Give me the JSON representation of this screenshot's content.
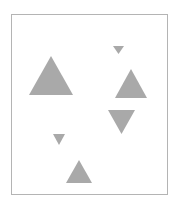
{
  "canvas": {
    "width": 179,
    "height": 205,
    "background": "#ffffff"
  },
  "frame": {
    "x": 11,
    "y": 14,
    "width": 157,
    "height": 181,
    "stroke": "#b4b4b4"
  },
  "shape_color": "#a9a9a9",
  "shapes": [
    {
      "name": "triangle-large-up",
      "direction": "up",
      "points": "51,56 29,95 73,95"
    },
    {
      "name": "triangle-small-down-top",
      "direction": "down",
      "points": "113,46 124,46 118.5,54"
    },
    {
      "name": "triangle-medium-up",
      "direction": "up",
      "points": "131,69 115,98 147,98"
    },
    {
      "name": "triangle-medium-down",
      "direction": "down",
      "points": "108,110 135,110 121.5,134"
    },
    {
      "name": "triangle-small-down-left",
      "direction": "down",
      "points": "53,134 65,134 59,145"
    },
    {
      "name": "triangle-small-up-bottom",
      "direction": "up",
      "points": "79,160 66,183 92,183"
    }
  ]
}
